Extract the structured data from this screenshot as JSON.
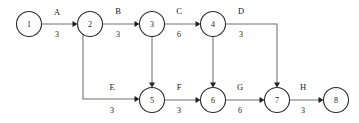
{
  "diagram": {
    "kind": "activity-on-arrow-network",
    "colors": {
      "background": "#ffffff",
      "node_stroke": "#2b2b2b",
      "node_fill": "#ffffff",
      "edge_stroke": "#6e6e6e",
      "arrow_fill": "#1f1f1f",
      "text": "#1a1a1a"
    },
    "nodes": [
      {
        "id": "n1",
        "label": "1",
        "cx": 29,
        "cy": 24,
        "r": 12.5
      },
      {
        "id": "n2",
        "label": "2",
        "cx": 90,
        "cy": 24,
        "r": 12.5
      },
      {
        "id": "n3",
        "label": "3",
        "cx": 152,
        "cy": 24,
        "r": 12.5
      },
      {
        "id": "n4",
        "label": "4",
        "cx": 213,
        "cy": 24,
        "r": 12.5
      },
      {
        "id": "n5",
        "label": "5",
        "cx": 152,
        "cy": 100,
        "r": 12.5
      },
      {
        "id": "n6",
        "label": "6",
        "cx": 213,
        "cy": 100,
        "r": 12.5
      },
      {
        "id": "n7",
        "label": "7",
        "cx": 277,
        "cy": 100,
        "r": 12.5
      },
      {
        "id": "n8",
        "label": "8",
        "cx": 336,
        "cy": 100,
        "r": 12.5
      }
    ],
    "edges": [
      {
        "id": "eA",
        "name": "A",
        "weight": "3",
        "from": "n1",
        "to": "n2",
        "path": "M 41.5 24 L 75 24",
        "arrow_at": {
          "x": 77.5,
          "y": 24,
          "dir": "right"
        },
        "name_pos": {
          "x": 57,
          "y": 12
        },
        "weight_pos": {
          "x": 57,
          "y": 34
        }
      },
      {
        "id": "eB",
        "name": "B",
        "weight": "3",
        "from": "n2",
        "to": "n3",
        "path": "M 102.5 24 L 137 24",
        "arrow_at": {
          "x": 139.5,
          "y": 24,
          "dir": "right"
        },
        "name_pos": {
          "x": 118,
          "y": 11
        },
        "weight_pos": {
          "x": 118,
          "y": 34
        }
      },
      {
        "id": "eC",
        "name": "C",
        "weight": "6",
        "from": "n3",
        "to": "n4",
        "path": "M 164.5 24 L 198 24",
        "arrow_at": {
          "x": 200.5,
          "y": 24,
          "dir": "right"
        },
        "name_pos": {
          "x": 179,
          "y": 11
        },
        "weight_pos": {
          "x": 179,
          "y": 34
        }
      },
      {
        "id": "eD",
        "name": "D",
        "weight": "3",
        "from": "n4",
        "to": "n7",
        "path": "M 225.5 24 L 277 24 L 277 85",
        "arrow_at": {
          "x": 277,
          "y": 87.5,
          "dir": "down"
        },
        "name_pos": {
          "x": 241,
          "y": 11
        },
        "weight_pos": {
          "x": 241,
          "y": 34
        }
      },
      {
        "id": "eE",
        "name": "E",
        "weight": "3",
        "from": "n2",
        "to": "n5",
        "path": "M 83 35 L 83 99 L 137 99",
        "arrow_at": {
          "x": 139.5,
          "y": 99,
          "dir": "right"
        },
        "name_pos": {
          "x": 112,
          "y": 87
        },
        "weight_pos": {
          "x": 112,
          "y": 110
        }
      },
      {
        "id": "eF",
        "name": "F",
        "weight": "3",
        "from": "n5",
        "to": "n6",
        "path": "M 164.5 100 L 198 100",
        "arrow_at": {
          "x": 200.5,
          "y": 100,
          "dir": "right"
        },
        "name_pos": {
          "x": 179,
          "y": 87
        },
        "weight_pos": {
          "x": 179,
          "y": 110
        }
      },
      {
        "id": "eG",
        "name": "G",
        "weight": "6",
        "from": "n6",
        "to": "n7",
        "path": "M 225.5 100 L 262 100",
        "arrow_at": {
          "x": 264.5,
          "y": 100,
          "dir": "right"
        },
        "name_pos": {
          "x": 240,
          "y": 87
        },
        "weight_pos": {
          "x": 240,
          "y": 110
        }
      },
      {
        "id": "eH",
        "name": "H",
        "weight": "3",
        "from": "n7",
        "to": "n8",
        "path": "M 289.5 100 L 321 100",
        "arrow_at": {
          "x": 323.5,
          "y": 100,
          "dir": "right"
        },
        "name_pos": {
          "x": 303,
          "y": 87
        },
        "weight_pos": {
          "x": 303,
          "y": 110
        }
      },
      {
        "id": "eDummy35",
        "name": "",
        "weight": "",
        "from": "n3",
        "to": "n5",
        "path": "M 152 36.5 L 152 85",
        "arrow_at": {
          "x": 152,
          "y": 87.5,
          "dir": "down"
        },
        "name_pos": null,
        "weight_pos": null
      },
      {
        "id": "eDummy46",
        "name": "",
        "weight": "",
        "from": "n4",
        "to": "n6",
        "path": "M 213 36.5 L 213 85",
        "arrow_at": {
          "x": 213,
          "y": 87.5,
          "dir": "down"
        },
        "name_pos": null,
        "weight_pos": null
      }
    ]
  }
}
